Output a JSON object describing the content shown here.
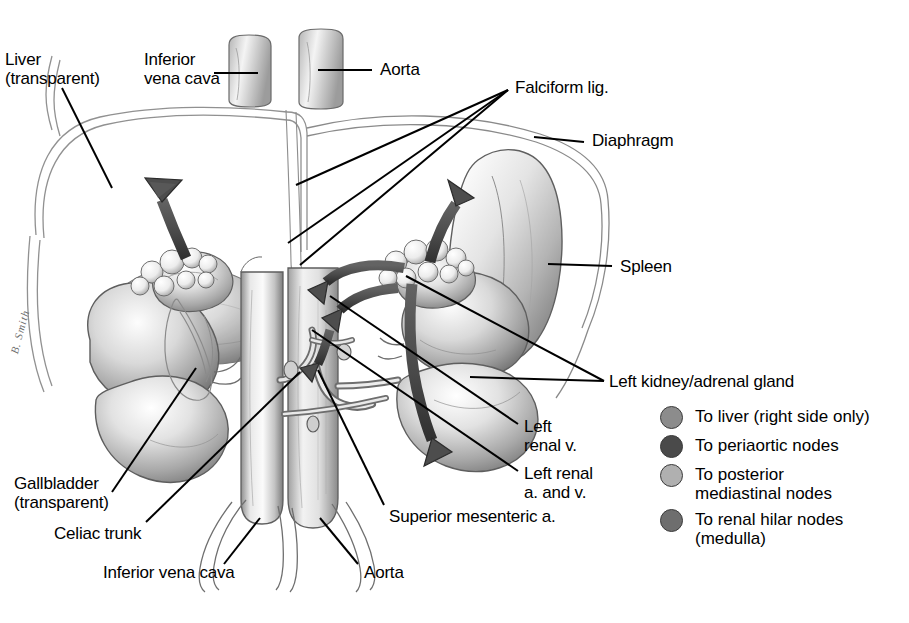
{
  "figure": {
    "background_color": "#ffffff",
    "width": 909,
    "height": 623,
    "medium": "pencil / graphite anatomical illustration",
    "signature": "B. Smith"
  },
  "labels": [
    {
      "id": "liver",
      "text": "Liver\n(transparent)",
      "x": 5,
      "y": 50,
      "align": "left"
    },
    {
      "id": "inferior-vena-cava-top",
      "text": "Inferior\nvena cava",
      "x": 144,
      "y": 50,
      "align": "left"
    },
    {
      "id": "aorta-top",
      "text": "Aorta",
      "x": 380,
      "y": 60,
      "align": "left"
    },
    {
      "id": "falciform-lig",
      "text": "Falciform lig.",
      "x": 515,
      "y": 78,
      "align": "left"
    },
    {
      "id": "diaphragm",
      "text": "Diaphragm",
      "x": 592,
      "y": 131,
      "align": "left"
    },
    {
      "id": "spleen",
      "text": "Spleen",
      "x": 620,
      "y": 257,
      "align": "left"
    },
    {
      "id": "left-kidney-adrenal",
      "text": "Left kidney/adrenal gland",
      "x": 609,
      "y": 372,
      "align": "left"
    },
    {
      "id": "left-renal-v",
      "text": "Left\nrenal v.",
      "x": 524,
      "y": 417,
      "align": "left"
    },
    {
      "id": "left-renal-a-and-v",
      "text": "Left renal\na. and v.",
      "x": 524,
      "y": 464,
      "align": "left"
    },
    {
      "id": "superior-mesenteric-a",
      "text": "Superior mesenteric a.",
      "x": 389,
      "y": 507,
      "align": "left"
    },
    {
      "id": "gallbladder",
      "text": "Gallbladder\n(transparent)",
      "x": 14,
      "y": 474,
      "align": "left"
    },
    {
      "id": "celiac-trunk",
      "text": "Celiac trunk",
      "x": 54,
      "y": 524,
      "align": "left"
    },
    {
      "id": "inferior-vena-cava-bottom",
      "text": "Inferior vena cava",
      "x": 103,
      "y": 563,
      "align": "left"
    },
    {
      "id": "aorta-bottom",
      "text": "Aorta",
      "x": 364,
      "y": 563,
      "align": "left"
    }
  ],
  "legend": {
    "items": [
      {
        "id": "to-liver",
        "label": "To liver (right side only)",
        "color": "#8c8c8c"
      },
      {
        "id": "to-periaortic-nodes",
        "label": "To periaortic nodes",
        "color": "#4a4a4a"
      },
      {
        "id": "to-posterior-mediastinal",
        "label": "To posterior\nmediastinal nodes",
        "color": "#b0b0b0"
      },
      {
        "id": "to-renal-hilar-nodes",
        "label": "To renal hilar nodes\n(medulla)",
        "color": "#6e6e6e"
      }
    ]
  },
  "structures": [
    {
      "id": "liver-outline",
      "name": "Liver (transparent outline)"
    },
    {
      "id": "inferior-vena-cava",
      "name": "Inferior vena cava"
    },
    {
      "id": "aorta",
      "name": "Aorta"
    },
    {
      "id": "spleen",
      "name": "Spleen"
    },
    {
      "id": "left-kidney",
      "name": "Left kidney"
    },
    {
      "id": "right-kidney",
      "name": "Right kidney"
    },
    {
      "id": "left-adrenal-gland",
      "name": "Left adrenal gland"
    },
    {
      "id": "right-adrenal-gland",
      "name": "Right adrenal gland"
    },
    {
      "id": "diaphragm",
      "name": "Diaphragm"
    },
    {
      "id": "celiac-trunk",
      "name": "Celiac trunk"
    },
    {
      "id": "superior-mesenteric-artery",
      "name": "Superior mesenteric artery"
    },
    {
      "id": "renal-vessels",
      "name": "Renal artery and vein"
    },
    {
      "id": "gallbladder",
      "name": "Gallbladder (transparent)"
    },
    {
      "id": "falciform-ligament",
      "name": "Falciform ligament"
    }
  ],
  "flow_arrows": [
    {
      "id": "arrow-to-liver-right",
      "direction": "up-left",
      "meaning": "To liver (right side only)"
    },
    {
      "id": "arrow-to-posterior-mediastinal",
      "direction": "up",
      "meaning": "To posterior mediastinal nodes"
    },
    {
      "id": "arrow-to-periaortic-1",
      "direction": "left",
      "meaning": "To periaortic nodes"
    },
    {
      "id": "arrow-to-periaortic-2",
      "direction": "left-down",
      "meaning": "To periaortic nodes"
    },
    {
      "id": "arrow-to-periaortic-3",
      "direction": "down-left",
      "meaning": "To periaortic nodes"
    },
    {
      "id": "arrow-to-renal-hilar",
      "direction": "down",
      "meaning": "To renal hilar nodes (medulla)"
    }
  ]
}
